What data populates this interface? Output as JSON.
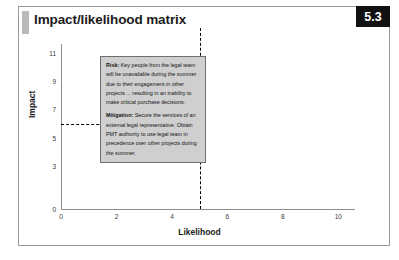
{
  "slide": {
    "title": "Impact/likelihood matrix",
    "badge": "5.3"
  },
  "callout": {
    "risk_label": "Risk:",
    "risk_text": " Key people from the legal team will be unavailable during the summer due to their engagement in other projects ... resulting in an inability to make critical purchase decisions.",
    "mitigation_label": "Mitigation:",
    "mitigation_text": " Secure the services of an external legal representative. Obtain PMT authority to use legal team in precedence over other projects during the summer."
  },
  "chart_data": {
    "type": "scatter",
    "title": "Impact/likelihood matrix",
    "xlabel": "Likelihood",
    "ylabel": "Impact",
    "xlim": [
      0,
      10.6
    ],
    "ylim": [
      0,
      11.6
    ],
    "xticks": [
      0,
      2,
      4,
      6,
      8,
      10
    ],
    "xtick_labels": [
      "0",
      "2",
      "4",
      "6",
      "8",
      "10"
    ],
    "yticks": [
      0,
      3,
      5,
      7,
      9,
      11
    ],
    "ytick_labels": [
      "0",
      "3",
      "5",
      "7",
      "9",
      "11"
    ],
    "grid": false,
    "legend": false,
    "points": [
      {
        "x": 5,
        "y": 6,
        "label": "Risk: legal team unavailable during summer"
      }
    ],
    "guide_lines": [
      {
        "orientation": "horizontal",
        "value": 6,
        "style": "dashed",
        "color": "#000000"
      },
      {
        "orientation": "vertical",
        "value": 5,
        "style": "dashed",
        "color": "#000000"
      }
    ]
  }
}
